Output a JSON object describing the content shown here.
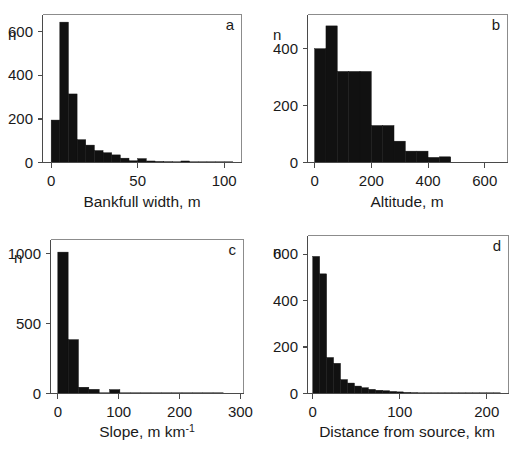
{
  "figure": {
    "background": "#ffffff",
    "bar_color": "#111111",
    "axis_color": "#4a4a4a",
    "frame_color": "#8c8c8c",
    "panel_count": 4,
    "layout": "2x2 grid of histograms"
  },
  "panels": [
    {
      "tag": "a",
      "y_axis_name": "n",
      "x_title": "Bankfull width, m",
      "x_ticks": [
        "0",
        "50",
        "100"
      ],
      "y_ticks": [
        "0",
        "200",
        "400",
        "600"
      ]
    },
    {
      "tag": "b",
      "y_axis_name": "n",
      "x_title": "Altitude, m",
      "x_ticks": [
        "0",
        "200",
        "400",
        "600"
      ],
      "y_ticks": [
        "0",
        "200",
        "400"
      ]
    },
    {
      "tag": "c",
      "y_axis_name": "n",
      "x_title_main": "Slope, m km",
      "x_title_sup": "-1",
      "x_title": "Slope, m km-1",
      "x_ticks": [
        "0",
        "100",
        "200",
        "300"
      ],
      "y_ticks": [
        "0",
        "500",
        "1000"
      ]
    },
    {
      "tag": "d",
      "y_axis_name": "n",
      "x_title": "Distance from source, km",
      "x_ticks": [
        "0",
        "100",
        "200"
      ],
      "y_ticks": [
        "0",
        "200",
        "400",
        "600"
      ]
    }
  ],
  "chart_data": [
    {
      "type": "bar",
      "panel": "a",
      "title": "",
      "xlabel": "Bankfull width, m",
      "ylabel": "n",
      "xlim": [
        -5,
        110
      ],
      "ylim": [
        0,
        680
      ],
      "xticks": [
        0,
        50,
        100
      ],
      "yticks": [
        0,
        200,
        400,
        600
      ],
      "grid": false,
      "bin_width": 5,
      "bin_edges": [
        0,
        5,
        10,
        15,
        20,
        25,
        30,
        35,
        40,
        45,
        50,
        55,
        60,
        65,
        70,
        75,
        80,
        85,
        90,
        95,
        100,
        105
      ],
      "values": [
        195,
        645,
        315,
        105,
        80,
        55,
        45,
        35,
        20,
        8,
        18,
        7,
        5,
        4,
        3,
        7,
        2,
        1,
        1,
        1,
        1
      ]
    },
    {
      "type": "bar",
      "panel": "b",
      "title": "",
      "xlabel": "Altitude, m",
      "ylabel": "n",
      "xlim": [
        -25,
        680
      ],
      "ylim": [
        0,
        520
      ],
      "xticks": [
        0,
        200,
        400,
        600
      ],
      "yticks": [
        0,
        200,
        400
      ],
      "grid": false,
      "bin_width": 40,
      "bin_edges": [
        0,
        40,
        80,
        120,
        160,
        200,
        240,
        280,
        320,
        360,
        400,
        440,
        480
      ],
      "values": [
        400,
        480,
        320,
        320,
        320,
        130,
        130,
        75,
        40,
        40,
        18,
        20
      ]
    },
    {
      "type": "bar",
      "panel": "c",
      "title": "",
      "xlabel": "Slope, m km-1",
      "ylabel": "n",
      "xlim": [
        -12,
        305
      ],
      "ylim": [
        0,
        1100
      ],
      "xticks": [
        0,
        100,
        200,
        300
      ],
      "yticks": [
        0,
        500,
        1000
      ],
      "grid": false,
      "bin_width": 17,
      "bin_edges": [
        0,
        17,
        34,
        51,
        68,
        85,
        102,
        119,
        136,
        153,
        170,
        187,
        204,
        221,
        238,
        255,
        272
      ],
      "values": [
        1010,
        385,
        45,
        30,
        3,
        28,
        2,
        1,
        1,
        1,
        1,
        1,
        1,
        1,
        1,
        1
      ]
    },
    {
      "type": "bar",
      "panel": "d",
      "title": "",
      "xlabel": "Distance from source, km",
      "ylabel": "n",
      "xlim": [
        -6,
        225
      ],
      "ylim": [
        0,
        680
      ],
      "xticks": [
        0,
        100,
        200
      ],
      "yticks": [
        0,
        200,
        400,
        600
      ],
      "grid": false,
      "bin_width": 8,
      "bin_edges": [
        0,
        8,
        16,
        24,
        32,
        40,
        48,
        56,
        64,
        72,
        80,
        88,
        96,
        104,
        112,
        120,
        128,
        136,
        144,
        152,
        160,
        168,
        176,
        184,
        192,
        200,
        208,
        216
      ],
      "values": [
        590,
        515,
        155,
        130,
        60,
        45,
        32,
        25,
        18,
        14,
        12,
        9,
        7,
        5,
        4,
        3,
        2,
        2,
        2,
        2,
        2,
        2,
        2,
        2,
        2,
        2,
        2
      ]
    }
  ]
}
